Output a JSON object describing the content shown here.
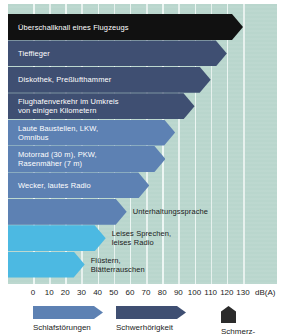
{
  "chart_data": {
    "type": "bar",
    "title": "",
    "xlabel": "dB(A)",
    "ylabel": "",
    "xlim": [
      0,
      130
    ],
    "grid": true,
    "orientation": "horizontal",
    "unit_label": "dB(A)",
    "tick_labels": [
      "0",
      "10",
      "20",
      "30",
      "40",
      "50",
      "60",
      "70",
      "80",
      "90",
      "100",
      "110",
      "120",
      "130"
    ],
    "tick_values": [
      0,
      10,
      20,
      30,
      40,
      50,
      60,
      70,
      80,
      90,
      100,
      110,
      120,
      130
    ],
    "legend_position": "bottom",
    "categories": [
      "Überschallknall eines Flugzeugs",
      "Tieffieger",
      "Diskothek, Preßlufthammer",
      "Flughafenverkehr im Umkreis\nvon einigen Kilometern",
      "Laute Baustellen, LKW,\nOmnibus",
      "Motorrad (30 m), PKW,\nRasenmäher (7 m)",
      "Wecker, lautes Radio",
      "Unterhaltungssprache",
      "Leises Sprechen,\nleises Radio",
      "Flüstern,\nBlätterrauschen"
    ],
    "values": [
      130,
      120,
      110,
      100,
      88,
      82,
      72,
      58,
      45,
      32
    ],
    "bars": [
      {
        "label": "Überschallknall eines Flugzeugs",
        "value": 130,
        "color": "#111111",
        "tier": "schmerz",
        "label_position": "inside"
      },
      {
        "label": "Tieffieger",
        "value": 120,
        "color": "#3f4f72",
        "tier": "schwerhoerigkeit",
        "label_position": "inside"
      },
      {
        "label": "Diskothek, Preßlufthammer",
        "value": 110,
        "color": "#3f4f72",
        "tier": "schwerhoerigkeit",
        "label_position": "inside"
      },
      {
        "label": "Flughafenverkehr im Umkreis\nvon einigen Kilometern",
        "value": 100,
        "color": "#3f4f72",
        "tier": "schwerhoerigkeit",
        "label_position": "inside"
      },
      {
        "label": "Laute Baustellen, LKW,\nOmnibus",
        "value": 88,
        "color": "#5d81b3",
        "tier": "schlafstoerungen",
        "label_position": "inside"
      },
      {
        "label": "Motorrad (30 m), PKW,\nRasenmäher (7 m)",
        "value": 82,
        "color": "#5d81b3",
        "tier": "schlafstoerungen",
        "label_position": "inside"
      },
      {
        "label": "Wecker, lautes Radio",
        "value": 72,
        "color": "#5d81b3",
        "tier": "schlafstoerungen",
        "label_position": "inside"
      },
      {
        "label": "Unterhaltungssprache",
        "value": 58,
        "color": "#5d81b3",
        "tier": "schlafstoerungen",
        "label_position": "outside"
      },
      {
        "label": "Leises Sprechen,\nleises Radio",
        "value": 45,
        "color": "#4cb9e2",
        "tier": "leise",
        "label_position": "outside"
      },
      {
        "label": "Flüstern,\nBlätterrauschen",
        "value": 32,
        "color": "#4cb9e2",
        "tier": "leise",
        "label_position": "outside"
      }
    ],
    "legend": [
      {
        "label": "Schlafstörungen",
        "color": "#5d81b3",
        "shape": "arrow-right"
      },
      {
        "label": "Schwerhörigkeit",
        "color": "#3f4f72",
        "shape": "arrow-right"
      },
      {
        "label": "Schmerz-",
        "color": "#2b2b2b",
        "shape": "arrow-up"
      }
    ]
  },
  "colors": {
    "background": "#b9d6cd",
    "gridline": "#eef6f3",
    "text": "#1b1b1b",
    "tier_schmerz": "#111111",
    "tier_schwerhoerigkeit": "#3f4f72",
    "tier_schlafstoerungen": "#5d81b3",
    "tier_leise": "#4cb9e2"
  }
}
